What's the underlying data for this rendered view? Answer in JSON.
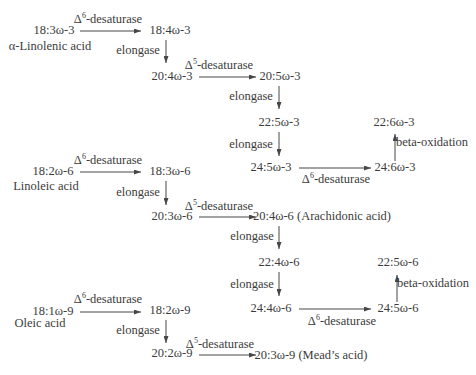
{
  "diagram": {
    "colors": {
      "background": "#ffffff",
      "text": "#3b3b3b",
      "arrow": "#474747"
    },
    "enzymes": {
      "d6": {
        "prefix": "Δ",
        "sup": "6",
        "suffix": "-desaturase"
      },
      "d5": {
        "prefix": "Δ",
        "sup": "5",
        "suffix": "-desaturase"
      },
      "elongase": "elongase",
      "beta_oxidation": "beta-oxidation"
    },
    "omega3": {
      "nodes": {
        "s18_3": "18:3ω-3",
        "common_name": "α-Linolenic acid",
        "s18_4": "18:4ω-3",
        "s20_4": "20:4ω-3",
        "s20_5": "20:5ω-3",
        "s22_5": "22:5ω-3",
        "s24_5": "24:5ω-3",
        "s24_6": "24:6ω-3",
        "s22_6": "22:6ω-3"
      }
    },
    "omega6": {
      "nodes": {
        "s18_2": "18:2ω-6",
        "common_name": "Linoleic acid",
        "s18_3": "18:3ω-6",
        "s20_3": "20:3ω-6",
        "s20_4": "20:4ω-6 (Arachidonic acid)",
        "s22_4": "22:4ω-6",
        "s24_4": "24:4ω-6",
        "s24_5": "24:5ω-6",
        "s22_5": "22:5ω-6"
      }
    },
    "omega9": {
      "nodes": {
        "s18_1": "18:1ω-9",
        "common_name": "Oleic acid",
        "s18_2": "18:2ω-9",
        "s20_2": "20:2ω-9",
        "s20_3": "20:3ω-9 (Mead’s acid)"
      }
    }
  }
}
